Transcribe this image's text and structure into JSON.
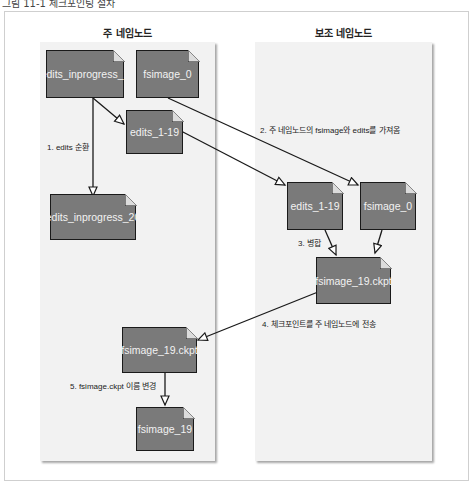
{
  "caption": "그림 11-1 체크포인팅 절차",
  "panels": {
    "primary": {
      "title": "주 네임노드"
    },
    "secondary": {
      "title": "보조 네임노드"
    }
  },
  "nodes": {
    "edits_inprogress_1": "edits_inprogress_1",
    "fsimage_0_primary": "fsimage_0",
    "edits_1_19_primary": "edits_1-19",
    "edits_inprogress_20": "edits_inprogress_20",
    "edits_1_19_secondary": "edits_1-19",
    "fsimage_0_secondary": "fsimage_0",
    "fsimage_19_ckpt_secondary": "fsimage_19.ckpt",
    "fsimage_19_ckpt_primary": "fsimage_19.ckpt",
    "fsimage_19": "fsimage_19"
  },
  "steps": {
    "step1": "1. edits 순환",
    "step2": "2. 주 네임노드의 fsimage와 edits를 가져옴",
    "step3": "3. 병합",
    "step4": "4. 체크포인트를 주 네임노드에 전송",
    "step5": "5. fsimage.ckpt 이름 변경"
  },
  "colors": {
    "node_fill": "#7a7a7a",
    "node_border": "#1a1a1a",
    "node_text": "#f2f2f2",
    "panel_bg": "#f2f2f2",
    "fold": "#dcdcdc"
  }
}
